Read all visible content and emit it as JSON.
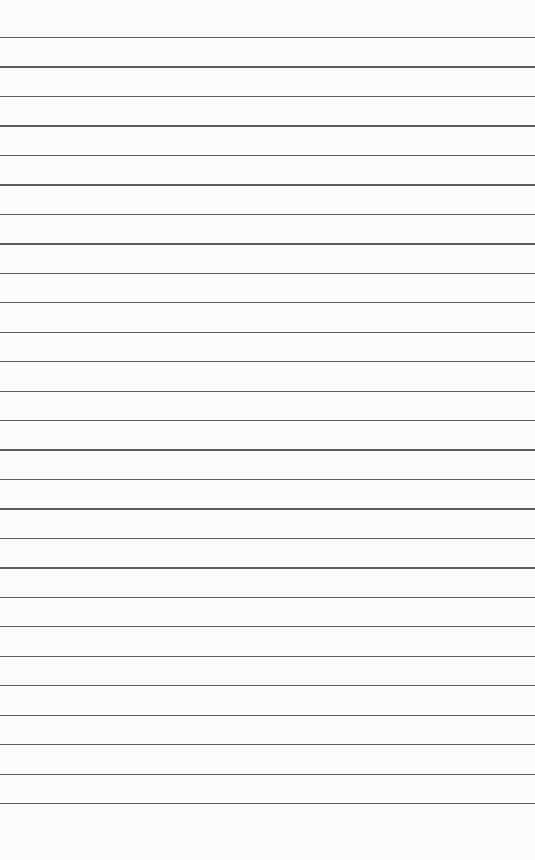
{
  "paper": {
    "type": "lined",
    "background": "#fcfcfc",
    "line_color": "#4a4a4a",
    "line_count": 27,
    "first_line_y": 37,
    "line_spacing": 29.46
  }
}
